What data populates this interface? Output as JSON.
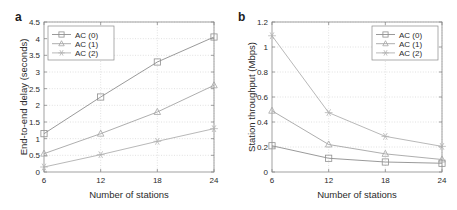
{
  "figure": {
    "background": "#ffffff",
    "axis_color": "#8a8a8a",
    "grid_color": "#c8c8c8",
    "text_color": "#2b2b2b"
  },
  "panels": [
    {
      "id": "panel-a",
      "label": "a",
      "legend_position": "top-left",
      "chart_data": {
        "type": "line",
        "title": "",
        "xlabel": "Number of stations",
        "ylabel": "End-to-end delay (seconds)",
        "x": [
          6,
          12,
          18,
          24
        ],
        "xticks": [
          "6",
          "12",
          "18",
          "24"
        ],
        "yticks": [
          "0",
          "0.5",
          "1",
          "1.5",
          "2",
          "2.5",
          "3",
          "3.5",
          "4",
          "4.5"
        ],
        "xlim": [
          6,
          24
        ],
        "ylim": [
          0,
          4.5
        ],
        "grid": true,
        "legend_position": "upper left",
        "series": [
          {
            "name": "AC (0)",
            "marker": "square",
            "color": "#8f8f8f",
            "values": [
              1.15,
              2.25,
              3.3,
              4.05
            ]
          },
          {
            "name": "AC (1)",
            "marker": "triangle",
            "color": "#a5a5a5",
            "values": [
              0.55,
              1.15,
              1.8,
              2.6
            ]
          },
          {
            "name": "AC (2)",
            "marker": "star",
            "color": "#b0b0b0",
            "values": [
              0.15,
              0.52,
              0.92,
              1.3
            ]
          }
        ]
      }
    },
    {
      "id": "panel-b",
      "label": "b",
      "legend_position": "top-right",
      "chart_data": {
        "type": "line",
        "title": "",
        "xlabel": "Number of stations",
        "ylabel": "Station throughput (Mbps)",
        "x": [
          6,
          12,
          18,
          24
        ],
        "xticks": [
          "6",
          "12",
          "18",
          "24"
        ],
        "yticks": [
          "0",
          "0.2",
          "0.4",
          "0.6",
          "0.8",
          "1",
          "1.2"
        ],
        "xlim": [
          6,
          24
        ],
        "ylim": [
          0,
          1.2
        ],
        "grid": true,
        "legend_position": "upper right",
        "series": [
          {
            "name": "AC (0)",
            "marker": "square",
            "color": "#8f8f8f",
            "values": [
              0.21,
              0.11,
              0.08,
              0.07
            ]
          },
          {
            "name": "AC (1)",
            "marker": "triangle",
            "color": "#a5a5a5",
            "values": [
              0.49,
              0.22,
              0.145,
              0.1
            ]
          },
          {
            "name": "AC (2)",
            "marker": "star",
            "color": "#b0b0b0",
            "values": [
              1.09,
              0.475,
              0.285,
              0.205
            ]
          }
        ]
      }
    }
  ]
}
